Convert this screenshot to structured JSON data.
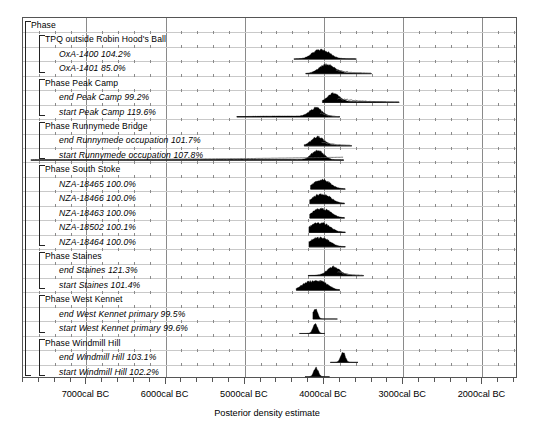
{
  "chart_data": {
    "type": "area",
    "title": "",
    "xlabel": "Posterior density estimate",
    "ylabel": "",
    "xlim": [
      -7800,
      -1550
    ],
    "x_axis_direction": "cal BC decreasing left to right",
    "grid": true,
    "legend": null,
    "xticks": [
      {
        "label": "7000cal BC",
        "value": -7000
      },
      {
        "label": "6000cal BC",
        "value": -6000
      },
      {
        "label": "5000cal BC",
        "value": -5000
      },
      {
        "label": "4000cal BC",
        "value": -4000
      },
      {
        "label": "3000cal BC",
        "value": -3000
      },
      {
        "label": "2000cal BC",
        "value": -2000
      }
    ],
    "minor_tick_interval": 200,
    "rows": [
      {
        "label": "Phase",
        "agreement": "",
        "kind": "group",
        "level": 0,
        "has_distribution": false
      },
      {
        "label": "TPQ outside Robin Hood's Ball",
        "agreement": "",
        "kind": "group",
        "level": 1,
        "has_distribution": false
      },
      {
        "label": "OxA-1400",
        "agreement": "104.2%",
        "kind": "date",
        "level": 2,
        "has_distribution": true,
        "range": [
          -4380,
          -3590
        ],
        "peaks": [
          -4100,
          -3970
        ],
        "style": "solid"
      },
      {
        "label": "OxA-1401",
        "agreement": "85.0%",
        "kind": "date",
        "level": 2,
        "has_distribution": true,
        "range": [
          -4230,
          -3400
        ],
        "peaks": [
          -4010,
          -3900
        ],
        "style": "solid-with-outline-tail"
      },
      {
        "label": "Phase Peak Camp",
        "agreement": "",
        "kind": "group",
        "level": 1,
        "has_distribution": false
      },
      {
        "label": "end Peak Camp",
        "agreement": "99.2%",
        "kind": "boundary",
        "level": 2,
        "has_distribution": true,
        "range": [
          -4020,
          -3050
        ],
        "peaks": [
          -3880
        ],
        "style": "solid-with-tail"
      },
      {
        "label": "start Peak Camp",
        "agreement": "119.6%",
        "kind": "boundary",
        "level": 2,
        "has_distribution": true,
        "range": [
          -5100,
          -3800
        ],
        "peaks": [
          -4100
        ],
        "style": "solid-with-tail"
      },
      {
        "label": "Phase Runnymede Bridge",
        "agreement": "",
        "kind": "group",
        "level": 1,
        "has_distribution": false
      },
      {
        "label": "end Runnymede occupation",
        "agreement": "101.7%",
        "kind": "boundary",
        "level": 2,
        "has_distribution": true,
        "range": [
          -4250,
          -3650
        ],
        "peaks": [
          -4080
        ],
        "style": "solid-with-tail"
      },
      {
        "label": "start Runnymede occupation",
        "agreement": "107.8%",
        "kind": "boundary",
        "level": 2,
        "has_distribution": true,
        "range": [
          -7700,
          -3750
        ],
        "peaks": [
          -4080
        ],
        "style": "solid-with-long-tail"
      },
      {
        "label": "Phase South Stoke",
        "agreement": "",
        "kind": "group",
        "level": 1,
        "has_distribution": false
      },
      {
        "label": "NZA-18465",
        "agreement": "100.0%",
        "kind": "date",
        "level": 2,
        "has_distribution": true,
        "range": [
          -4170,
          -3730
        ],
        "peaks": [
          -4080,
          -3970
        ],
        "style": "solid"
      },
      {
        "label": "NZA-18466",
        "agreement": "100.0%",
        "kind": "date",
        "level": 2,
        "has_distribution": true,
        "range": [
          -4180,
          -3740
        ],
        "peaks": [
          -4090,
          -3960
        ],
        "style": "solid"
      },
      {
        "label": "NZA-18463",
        "agreement": "100.0%",
        "kind": "date",
        "level": 2,
        "has_distribution": true,
        "range": [
          -4180,
          -3740
        ],
        "peaks": [
          -4090,
          -3960
        ],
        "style": "solid"
      },
      {
        "label": "NZA-18502",
        "agreement": "100.1%",
        "kind": "date",
        "level": 2,
        "has_distribution": true,
        "range": [
          -4190,
          -3730
        ],
        "peaks": [
          -4120,
          -3980
        ],
        "style": "solid"
      },
      {
        "label": "NZA-18464",
        "agreement": "100.0%",
        "kind": "date",
        "level": 2,
        "has_distribution": true,
        "range": [
          -4190,
          -3730
        ],
        "peaks": [
          -4120,
          -3980
        ],
        "style": "solid"
      },
      {
        "label": "Phase Staines",
        "agreement": "",
        "kind": "group",
        "level": 1,
        "has_distribution": false
      },
      {
        "label": "end Staines",
        "agreement": "121.3%",
        "kind": "boundary",
        "level": 2,
        "has_distribution": true,
        "range": [
          -4200,
          -3500
        ],
        "peaks": [
          -3880
        ],
        "style": "solid-with-tail"
      },
      {
        "label": "start Staines",
        "agreement": "101.4%",
        "kind": "boundary",
        "level": 2,
        "has_distribution": true,
        "range": [
          -4350,
          -3800
        ],
        "peaks": [
          -4220,
          -4090,
          -3990
        ],
        "style": "solid"
      },
      {
        "label": "Phase West Kennet",
        "agreement": "",
        "kind": "group",
        "level": 1,
        "has_distribution": false
      },
      {
        "label": "end West Kennet primary",
        "agreement": "99.5%",
        "kind": "boundary",
        "level": 2,
        "has_distribution": true,
        "range": [
          -4140,
          -3830
        ],
        "peaks": [
          -4110
        ],
        "style": "narrow-spike"
      },
      {
        "label": "start West Kennet primary",
        "agreement": "99.6%",
        "kind": "boundary",
        "level": 2,
        "has_distribution": true,
        "range": [
          -4310,
          -3990
        ],
        "peaks": [
          -4110
        ],
        "style": "narrow-spike"
      },
      {
        "label": "Phase Windmill Hill",
        "agreement": "",
        "kind": "group",
        "level": 1,
        "has_distribution": false
      },
      {
        "label": "end Windmill Hill",
        "agreement": "103.1%",
        "kind": "boundary",
        "level": 2,
        "has_distribution": true,
        "range": [
          -3920,
          -3570
        ],
        "peaks": [
          -3760
        ],
        "style": "narrow-spike"
      },
      {
        "label": "start Windmill Hill",
        "agreement": "102.2%",
        "kind": "boundary",
        "level": 2,
        "has_distribution": true,
        "range": [
          -4240,
          -3930
        ],
        "peaks": [
          -4100
        ],
        "style": "narrow-spike"
      }
    ],
    "brackets": [
      {
        "label": "Phase",
        "from_row": 0,
        "to_row": 24,
        "level": 0
      },
      {
        "label": "TPQ outside Robin Hood's Ball",
        "from_row": 1,
        "to_row": 3,
        "level": 1
      },
      {
        "label": "Phase Peak Camp",
        "from_row": 4,
        "to_row": 6,
        "level": 1
      },
      {
        "label": "Phase Runnymede Bridge",
        "from_row": 7,
        "to_row": 9,
        "level": 1
      },
      {
        "label": "Phase South Stoke",
        "from_row": 10,
        "to_row": 15,
        "level": 1
      },
      {
        "label": "Phase Staines",
        "from_row": 16,
        "to_row": 18,
        "level": 1
      },
      {
        "label": "Phase West Kennet",
        "from_row": 19,
        "to_row": 21,
        "level": 1
      },
      {
        "label": "Phase Windmill Hill",
        "from_row": 22,
        "to_row": 24,
        "level": 1
      }
    ],
    "colors": {
      "fill": "#000000",
      "outline": "#555555",
      "grid_major": "#8a8a8a",
      "grid_minor": "#c9c9c9",
      "frame": "#555555",
      "background": "#ffffff"
    }
  }
}
